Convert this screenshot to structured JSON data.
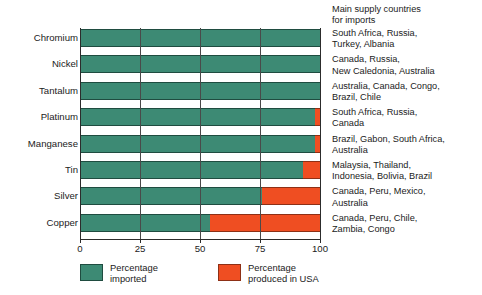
{
  "chart_data": {
    "type": "bar",
    "orientation": "horizontal",
    "stacked": true,
    "title": "",
    "xlabel": "",
    "ylabel": "",
    "xlim": [
      0,
      100
    ],
    "xticks": [
      0,
      25,
      50,
      75,
      100
    ],
    "xtick_labels": [
      "0",
      "25",
      "50",
      "75",
      "100"
    ],
    "grid": true,
    "legend_position": "bottom",
    "categories": [
      "Chromium",
      "Nickel",
      "Tantalum",
      "Platinum",
      "Manganese",
      "Tin",
      "Silver",
      "Copper"
    ],
    "series": [
      {
        "name": "Percentage imported",
        "color": "#3d8a74",
        "values": [
          100,
          100,
          100,
          98,
          98,
          93,
          76,
          54
        ]
      },
      {
        "name": "Percentage produced in USA",
        "color": "#ef4e22",
        "values": [
          0,
          0,
          0,
          2,
          2,
          7,
          24,
          46
        ]
      }
    ]
  },
  "supply_header": "Main supply countries\nfor imports",
  "supply_countries": [
    "South Africa, Russia,\nTurkey, Albania",
    "Canada, Russia,\nNew Caledonia, Australia",
    "Australia, Canada, Congo,\nBrazil, Chile",
    "South Africa, Russia,\nCanada",
    "Brazil, Gabon, South Africa,\nAustralia",
    "Malaysia, Thailand,\nIndonesia, Bolivia, Brazil",
    "Canada, Peru, Mexico,\nAustralia",
    "Canada, Peru, Chile,\nZambia, Congo"
  ],
  "legend": [
    {
      "label": "Percentage\nimported",
      "color": "#3d8a74",
      "swatch": "green"
    },
    {
      "label": "Percentage\nproduced in USA",
      "color": "#ef4e22",
      "swatch": "red"
    }
  ],
  "colors": {
    "imported": "#3d8a74",
    "produced_in_usa": "#ef4e22",
    "axis": "#2c2c2c",
    "background": "#ffffff"
  }
}
